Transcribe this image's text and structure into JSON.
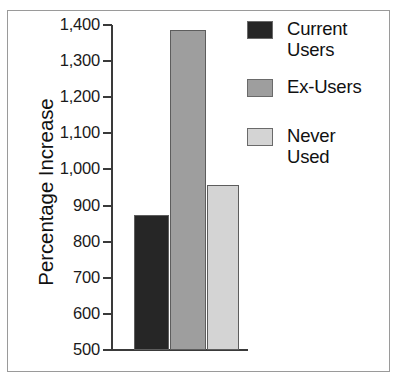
{
  "chart_data": {
    "type": "bar",
    "title": "",
    "xlabel": "",
    "ylabel": "Percentage Increase",
    "ylim": [
      500,
      1400
    ],
    "grid": false,
    "legend_position": "top-right",
    "categories": [
      "Current Users",
      "Ex-Users",
      "Never Used"
    ],
    "values": [
      874,
      1385,
      957
    ],
    "ytick_labels": [
      "1,400",
      "1,300",
      "1,200",
      "1,100",
      "1,000",
      "900",
      "800",
      "700",
      "600",
      "500"
    ],
    "ytick_values": [
      1400,
      1300,
      1200,
      1100,
      1000,
      900,
      800,
      700,
      600,
      500
    ],
    "series": [
      {
        "name": "Current Users",
        "value": 874,
        "color": "#262626"
      },
      {
        "name": "Ex-Users",
        "value": 1385,
        "color": "#9e9e9e"
      },
      {
        "name": "Never Used",
        "value": 957,
        "color": "#d4d4d4"
      }
    ]
  },
  "axis": {
    "y_title": "Percentage Increase",
    "ticks": [
      {
        "label": "1,400",
        "value": 1400
      },
      {
        "label": "1,300",
        "value": 1300
      },
      {
        "label": "1,200",
        "value": 1200
      },
      {
        "label": "1,100",
        "value": 1100
      },
      {
        "label": "1,000",
        "value": 1000
      },
      {
        "label": "900",
        "value": 900
      },
      {
        "label": "800",
        "value": 800
      },
      {
        "label": "700",
        "value": 700
      },
      {
        "label": "600",
        "value": 600
      },
      {
        "label": "500",
        "value": 500
      }
    ]
  },
  "legend": {
    "entries": [
      {
        "label": "Current\nUsers",
        "color": "#262626"
      },
      {
        "label": "Ex-Users",
        "color": "#9e9e9e"
      },
      {
        "label": "Never\nUsed",
        "color": "#d4d4d4"
      }
    ]
  },
  "colors": {
    "current_users": "#262626",
    "ex_users": "#9e9e9e",
    "never_used": "#d4d4d4",
    "axis": "#3a3a3a",
    "frame": "#9a9a9a",
    "text": "#111111",
    "background": "#ffffff"
  }
}
